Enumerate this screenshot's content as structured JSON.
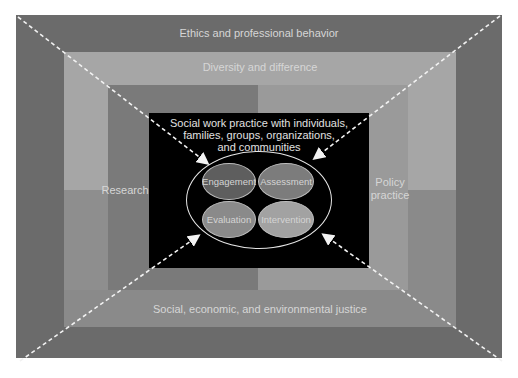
{
  "diagram": {
    "outer_frame_label": "Ethics and professional behavior",
    "second_frame_label": "Diversity and difference",
    "left_column_label": "Research",
    "right_column_label_line1": "Policy",
    "right_column_label_line2": "practice",
    "bottom_band_label": "Social, economic, and environmental justice",
    "center_title_line1": "Social work practice with individuals,",
    "center_title_line2": "families, groups, organizations,",
    "center_title_line3": "and communities",
    "core_stages": [
      {
        "label": "Engagement"
      },
      {
        "label": "Assessment"
      },
      {
        "label": "Evaluation"
      },
      {
        "label": "Intervention"
      }
    ]
  },
  "colors": {
    "outer": "#6b6b6b",
    "diversity_top": "#a6a6a6",
    "diversity_bottom": "#8e8e8e",
    "research": "#7a7a7a",
    "policy": "#9a9a9a",
    "justice_band": "#8a8a8a",
    "center": "#000000",
    "engagement": "#5e5e5e",
    "assessment": "#7c7c7c",
    "evaluation": "#8a8a8a",
    "intervention": "#a2a2a2"
  }
}
